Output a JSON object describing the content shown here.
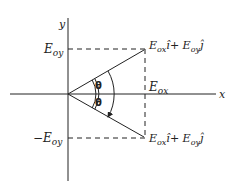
{
  "diagram": {
    "axes": {
      "x_label": "x",
      "y_label": "y"
    },
    "labels": {
      "e_oy": "E",
      "e_oy_sub": "oy",
      "neg_e_oy_prefix": "−E",
      "neg_e_oy_sub": "oy",
      "e_ox": "E",
      "e_ox_sub": "ox",
      "upper_vector": {
        "e1": "E",
        "s1": "ox",
        "u1": "î+ ",
        "e2": "E",
        "s2": "oy",
        "u2": "ĵ"
      },
      "lower_vector": {
        "e1": "E",
        "s1": "ox",
        "u1": "î+ ",
        "e2": "E",
        "s2": "oy",
        "u2": "ĵ"
      },
      "theta_upper": "θ",
      "theta_lower": "θ"
    },
    "colors": {
      "stroke": "#222222",
      "background": "#ffffff"
    }
  }
}
